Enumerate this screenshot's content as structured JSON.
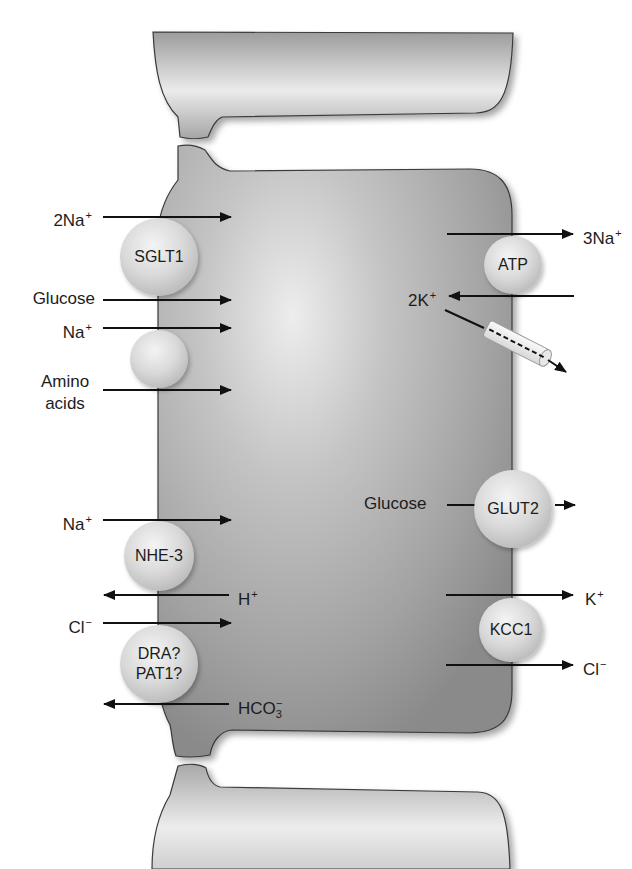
{
  "diagram": {
    "type": "epithelial cell ion transport",
    "colors": {
      "cell_fill": "#9a9a9a",
      "cell_highlight": "#ececec",
      "outline": "#3a3a3a",
      "arrow": "#111111",
      "protein": "#d6d6d6"
    }
  },
  "apical_side": {
    "transporters": [
      {
        "name": "SGLT1",
        "label": "SGLT1",
        "substrates_in": [
          "2Na+",
          "Glucose"
        ]
      },
      {
        "name": "amino-acid-transporter",
        "label": "",
        "substrates_in": [
          "Na+",
          "Amino acids"
        ]
      },
      {
        "name": "NHE-3",
        "label": "NHE-3",
        "substrates_in": [
          "Na+"
        ],
        "substrates_out": [
          "H+"
        ]
      },
      {
        "name": "DRA-PAT1",
        "label_line1": "DRA?",
        "label_line2": "PAT1?",
        "substrates_in": [
          "Cl−"
        ],
        "substrates_out": [
          "HCO3−"
        ]
      }
    ],
    "labels": {
      "na2": {
        "base": "2Na",
        "sup": "+"
      },
      "glucose": "Glucose",
      "na_aa": {
        "base": "Na",
        "sup": "+"
      },
      "amino_l1": "Amino",
      "amino_l2": "acids",
      "na_nhe": {
        "base": "Na",
        "sup": "+"
      },
      "h": {
        "base": "H",
        "sup": "+"
      },
      "cl": {
        "base": "Cl",
        "sup": "−"
      },
      "hco3": {
        "base": "HCO",
        "sub": "3",
        "sup": "−"
      }
    }
  },
  "basolateral_side": {
    "transporters": [
      {
        "name": "Na-K-ATPase",
        "label": "ATP",
        "substrates_out": [
          "3Na+"
        ],
        "substrates_in": [
          "2K+"
        ]
      },
      {
        "name": "K-channel",
        "label": "",
        "substrates_out": [
          "K+"
        ]
      },
      {
        "name": "GLUT2",
        "label": "GLUT2",
        "substrates_out": [
          "Glucose"
        ]
      },
      {
        "name": "KCC1",
        "label": "KCC1",
        "substrates_out": [
          "K+",
          "Cl−"
        ]
      }
    ],
    "labels": {
      "na3": {
        "base": "3Na",
        "sup": "+"
      },
      "k2": {
        "base": "2K",
        "sup": "+"
      },
      "glucose": "Glucose",
      "k": {
        "base": "K",
        "sup": "+"
      },
      "cl": {
        "base": "Cl",
        "sup": "−"
      }
    }
  }
}
